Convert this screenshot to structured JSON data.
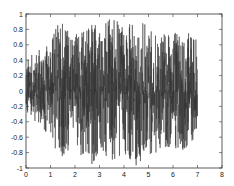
{
  "chart_data": {
    "type": "line",
    "title": "",
    "xlabel": "",
    "ylabel": "",
    "xlim": [
      0,
      8
    ],
    "ylim": [
      -1,
      1
    ],
    "grid": false,
    "legend": null,
    "xticks": [
      "0",
      "1",
      "2",
      "3",
      "4",
      "5",
      "6",
      "7",
      "8"
    ],
    "yticks": [
      "1",
      "0.8",
      "0.6",
      "0.4",
      "0.2",
      "0",
      "-0.2",
      "-0.4",
      "-0.6",
      "-0.8",
      "-1"
    ],
    "series": [
      {
        "name": "signal",
        "color": "#333333",
        "description": "Dense noise-like waveform from x=0 to x=7, amplitude envelope rising from ~0.4 at start to ~0.9-1.0 around x=1.2-5, tapering slightly to ~0.6-0.7 near x=7",
        "envelope": {
          "x": [
            0,
            0.5,
            1.0,
            1.3,
            2.0,
            2.7,
            3.0,
            3.5,
            4.0,
            4.5,
            5.0,
            5.5,
            6.0,
            6.5,
            7.0
          ],
          "upper": [
            0.4,
            0.55,
            0.6,
            1.0,
            0.75,
            0.95,
            0.85,
            0.95,
            0.9,
            0.95,
            0.85,
            0.75,
            0.75,
            0.8,
            0.65
          ],
          "lower": [
            -0.3,
            -0.45,
            -0.6,
            -0.9,
            -0.75,
            -1.0,
            -0.85,
            -0.9,
            -0.85,
            -1.0,
            -0.85,
            -0.8,
            -0.75,
            -0.8,
            -0.6
          ]
        }
      }
    ]
  }
}
